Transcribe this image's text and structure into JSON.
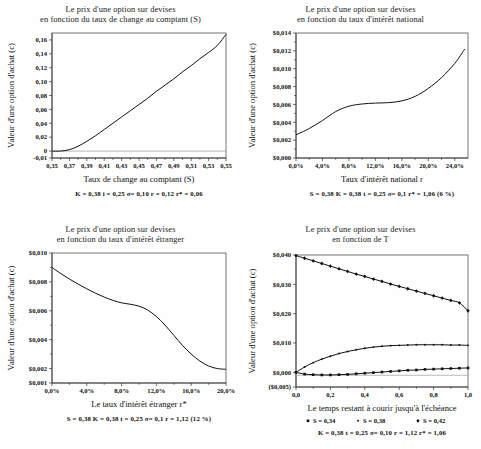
{
  "document": {
    "kind": "scanned-figure-page",
    "panel_count": 4
  },
  "panels": [
    {
      "id": "panel-1",
      "title_line1": "Le prix d'une option sur devises",
      "title_line2": "en fonction du taux de change au comptant (S)",
      "ylabel": "Valeur d'une option d'achat (c)",
      "xlabel": "Taux de change au comptant (S)",
      "caption": "K = 0,38   i = 0,25    σ= 0,10      r = 0,12     r* = 0,06",
      "yticks": [
        "0,16",
        "0,14",
        "0,12",
        "0,10",
        "0,08",
        "0,06",
        "0,04",
        "0,02",
        "0",
        "-0,01"
      ],
      "xticks": [
        "0,35",
        "0,37",
        "0,39",
        "0,41",
        "0,43",
        "0,45",
        "0,47",
        "0,49",
        "0,51",
        "0,53",
        "0,55"
      ]
    },
    {
      "id": "panel-2",
      "title_line1": "Le prix d'une option sur devises",
      "title_line2": "en fonction du taux d'intérêt national",
      "ylabel": "Valeur d'une option d'achat (c)",
      "xlabel": "Taux d'intérêt national r",
      "caption": "S = 0,38  K = 0,38   t = 0,25    σ= 0,1   r* = 1,06 (6 %)",
      "yticks": [
        "$0,014",
        "$0,012",
        "$0,010",
        "$0,008",
        "$0,006",
        "$0,004",
        "$0,002",
        "$0,000"
      ],
      "xticks": [
        "0,0%",
        "4,0%",
        "8,0%",
        "12,0%",
        "16,0%",
        "20,0%",
        "24,0%"
      ]
    },
    {
      "id": "panel-3",
      "title_line1": "Le prix d'une option sur devises",
      "title_line2": "en fonction du taux d'intérêt étranger",
      "ylabel": "Valeur d'une option d'achat (c)",
      "xlabel": "Le taux d'intérêt étranger r*",
      "caption": "S = 0,38   K = 0,38    t = 0,25    σ= 0,1    r = 1,12 (12 %)",
      "yticks": [
        "$0,010",
        "$0,008",
        "$0,006",
        "$0,004",
        "$0,002",
        "$0,001"
      ],
      "xticks": [
        "0,0%",
        "4,0%",
        "8,0%",
        "12,0%",
        "16,0%",
        "20,0%"
      ]
    },
    {
      "id": "panel-4",
      "title_line1": "Le prix d'une option sur devises",
      "title_line2": "en fonction de T",
      "ylabel": "Valeur d'une option d'achat (c)",
      "xlabel": "Le temps restant à courir jusqu'à l'échéance",
      "caption": "K = 0,38  t = 0,25  σ= 0,10    r = 1,12    r* = 1,06",
      "legend": [
        {
          "marker": "square",
          "label": "S = 0,34"
        },
        {
          "marker": "dot",
          "label": "S = 0,38"
        },
        {
          "marker": "diamond",
          "label": "S = 0,42"
        }
      ],
      "yticks": [
        "$0,040",
        "$0,030",
        "$0,020",
        "$0,010",
        "$0,000",
        "($0,005)"
      ],
      "xticks": [
        "0,0",
        "0,2",
        "0,4",
        "0,6",
        "0,8",
        "1,0"
      ]
    }
  ],
  "chart_data": [
    {
      "type": "line",
      "title": "Le prix d'une option sur devises en fonction du taux de change au comptant (S)",
      "xlabel": "Taux de change au comptant (S)",
      "ylabel": "Valeur d'une option d'achat (c)",
      "xlim": [
        0.35,
        0.55
      ],
      "ylim": [
        -0.01,
        0.17
      ],
      "grid": false,
      "legend": "none",
      "x": [
        0.35,
        0.36,
        0.37,
        0.38,
        0.39,
        0.4,
        0.41,
        0.42,
        0.43,
        0.44,
        0.45,
        0.46,
        0.47,
        0.48,
        0.49,
        0.5,
        0.51,
        0.52,
        0.53,
        0.54,
        0.55
      ],
      "values": [
        0.0,
        0.0,
        0.002,
        0.007,
        0.014,
        0.022,
        0.031,
        0.04,
        0.049,
        0.058,
        0.067,
        0.076,
        0.086,
        0.095,
        0.104,
        0.114,
        0.123,
        0.133,
        0.142,
        0.152,
        0.168
      ],
      "parameters": {
        "K": "0,38",
        "i": "0,25",
        "sigma": "0,10",
        "r": "0,12",
        "r_star": "0,06"
      }
    },
    {
      "type": "line",
      "title": "Le prix d'une option sur devises en fonction du taux d'intérêt national",
      "xlabel": "Taux d'intérêt national r",
      "ylabel": "Valeur d'une option d'achat (c)",
      "xlim": [
        0,
        26
      ],
      "ylim": [
        0.0,
        0.014
      ],
      "xunit": "%",
      "grid": false,
      "legend": "none",
      "x": [
        0,
        2,
        4,
        6,
        8,
        10,
        12,
        14,
        16,
        18,
        20,
        22,
        24,
        25.5
      ],
      "values": [
        0.0026,
        0.0033,
        0.0042,
        0.0052,
        0.0058,
        0.00605,
        0.00615,
        0.0062,
        0.0064,
        0.0069,
        0.0078,
        0.009,
        0.0106,
        0.0122
      ],
      "parameters": {
        "S": "0,38",
        "K": "0,38",
        "t": "0,25",
        "sigma": "0,1",
        "r_star": "1,06 (6 %)"
      }
    },
    {
      "type": "line",
      "title": "Le prix d'une option sur devises en fonction du taux d'intérêt étranger",
      "xlabel": "Le taux d'intérêt étranger r*",
      "ylabel": "Valeur d'une option d'achat (c)",
      "xlim": [
        0,
        20
      ],
      "ylim": [
        0.001,
        0.01
      ],
      "xunit": "%",
      "grid": false,
      "legend": "none",
      "x": [
        0,
        1,
        2,
        3,
        4,
        5,
        6,
        7,
        8,
        9,
        10,
        11,
        12,
        13,
        14,
        15,
        16,
        17,
        18,
        19,
        20
      ],
      "values": [
        0.009,
        0.00858,
        0.0082,
        0.00785,
        0.00752,
        0.00722,
        0.00695,
        0.00672,
        0.00655,
        0.00645,
        0.00632,
        0.00605,
        0.0056,
        0.005,
        0.0043,
        0.0036,
        0.003,
        0.00252,
        0.00218,
        0.002,
        0.00195
      ],
      "parameters": {
        "S": "0,38",
        "K": "0,38",
        "t": "0,25",
        "sigma": "0,1",
        "r": "1,12 (12 %)"
      }
    },
    {
      "type": "line",
      "title": "Le prix d'une option sur devises en fonction de T",
      "xlabel": "Le temps restant à courir jusqu'à l'échéance",
      "ylabel": "Valeur d'une option d'achat (c)",
      "xlim": [
        0,
        1
      ],
      "ylim": [
        -0.005,
        0.04
      ],
      "grid": false,
      "legend": "below",
      "x": [
        0.0,
        0.05,
        0.1,
        0.15,
        0.2,
        0.25,
        0.3,
        0.35,
        0.4,
        0.45,
        0.5,
        0.55,
        0.6,
        0.65,
        0.7,
        0.75,
        0.8,
        0.85,
        0.9,
        0.95,
        1.0
      ],
      "series": [
        {
          "name": "S = 0,42",
          "marker": "diamond",
          "values": [
            0.0398,
            0.0389,
            0.038,
            0.0371,
            0.0362,
            0.0353,
            0.0344,
            0.0335,
            0.0327,
            0.0318,
            0.031,
            0.0301,
            0.0293,
            0.0285,
            0.0277,
            0.0269,
            0.0261,
            0.0253,
            0.0245,
            0.0237,
            0.021
          ]
        },
        {
          "name": "S = 0,38",
          "marker": "dot",
          "values": [
            0.0,
            0.0018,
            0.0033,
            0.0045,
            0.0055,
            0.0064,
            0.0071,
            0.0077,
            0.0082,
            0.0086,
            0.0089,
            0.0091,
            0.0092,
            0.0093,
            0.0094,
            0.0094,
            0.0094,
            0.0094,
            0.0093,
            0.0093,
            0.0092
          ]
        },
        {
          "name": "S = 0,34",
          "marker": "square",
          "values": [
            0.0,
            -0.0006,
            -0.0008,
            -0.0009,
            -0.0009,
            -0.0008,
            -0.0007,
            -0.0005,
            -0.0003,
            -0.0001,
            0.0001,
            0.0003,
            0.0005,
            0.0007,
            0.0008,
            0.001,
            0.0011,
            0.0012,
            0.0013,
            0.0014,
            0.0015
          ]
        }
      ],
      "parameters": {
        "K": "0,38",
        "t": "0,25",
        "sigma": "0,10",
        "r": "1,12",
        "r_star": "1,06"
      }
    }
  ]
}
